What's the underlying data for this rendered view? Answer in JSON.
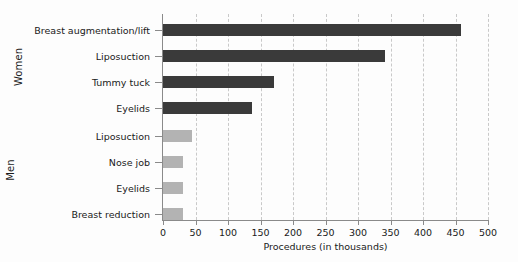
{
  "chart_data": {
    "type": "bar",
    "orientation": "horizontal",
    "title": "",
    "xlabel": "Procedures (in thousands)",
    "ylabel": "",
    "xlim": [
      0,
      500
    ],
    "xticks": [
      0,
      50,
      100,
      150,
      200,
      250,
      300,
      350,
      400,
      450,
      500
    ],
    "grid": true,
    "grid_axis": "x",
    "grid_style": "dashed",
    "legend": "none",
    "groups": [
      {
        "name": "Women",
        "color": "#3a3a3a",
        "categories": [
          "Breast augmentation/lift",
          "Liposuction",
          "Tummy tuck",
          "Eyelids"
        ],
        "values": [
          458,
          341,
          171,
          137
        ]
      },
      {
        "name": "Men",
        "color": "#b3b3b3",
        "categories": [
          "Liposuction",
          "Nose job",
          "Eyelids",
          "Breast reduction"
        ],
        "values": [
          45,
          30,
          30,
          30
        ]
      }
    ]
  },
  "colors": {
    "women_bar": "#3a3a3a",
    "men_bar": "#b3b3b3",
    "gridline": "#c9c9c9",
    "axis": "#8a8a8a",
    "text": "#1a1a1a",
    "background": "#fdfdfd"
  }
}
